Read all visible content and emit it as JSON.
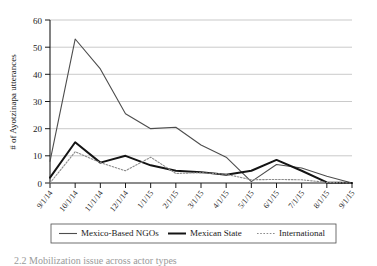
{
  "chart_data": {
    "type": "line",
    "title": "",
    "xlabel": "",
    "ylabel": "# of Ayotzinapa utterances",
    "ylim": [
      0,
      60
    ],
    "yticks": [
      0,
      10,
      20,
      30,
      40,
      50,
      60
    ],
    "grid": true,
    "legend_position": "bottom",
    "categories": [
      "9/1/14",
      "10/1/14",
      "11/1/14",
      "12/1/14",
      "1/1/15",
      "2/1/15",
      "3/1/15",
      "4/1/15",
      "5/1/15",
      "6/1/15",
      "7/1/15",
      "8/1/15",
      "9/1/15"
    ],
    "series": [
      {
        "name": "Mexico-Based NGOs",
        "style": "solid-thin",
        "color": "#4d4d4d",
        "values": [
          8,
          53,
          42,
          25.5,
          20,
          20.5,
          14,
          9.5,
          0.5,
          6.8,
          5.5,
          2.5,
          0
        ]
      },
      {
        "name": "Mexican State",
        "style": "solid-thick",
        "color": "#141414",
        "values": [
          2,
          15,
          7.5,
          10,
          6.5,
          4.5,
          4,
          3,
          4.5,
          8.5,
          4.5,
          0.2,
          0
        ]
      },
      {
        "name": "International",
        "style": "dotted",
        "color": "#8c8c8c",
        "values": [
          0,
          11.5,
          7.5,
          4.5,
          9.5,
          3.5,
          3.8,
          3.2,
          1.2,
          1.3,
          1.2,
          0.2,
          0
        ]
      }
    ]
  },
  "legend": {
    "items": [
      {
        "label": "Mexico-Based NGOs"
      },
      {
        "label": "Mexican State"
      },
      {
        "label": "International"
      }
    ]
  },
  "caption": {
    "text": "2.2 Mobilization issue across actor types"
  }
}
